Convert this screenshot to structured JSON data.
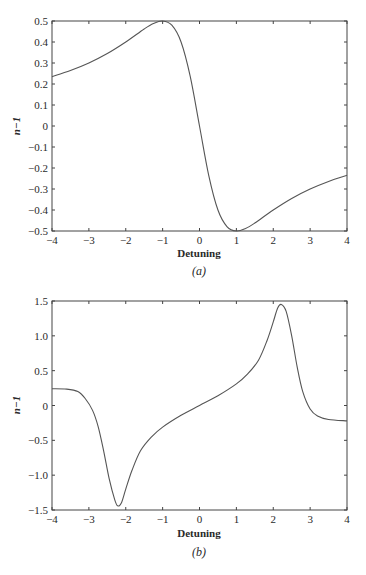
{
  "chart_data": [
    {
      "id": "a",
      "type": "line",
      "caption": "(a)",
      "title": "",
      "xlabel": "Detuning",
      "ylabel": "n−1",
      "xlim": [
        -4,
        4
      ],
      "ylim": [
        -0.5,
        0.5
      ],
      "xticks": [
        -4,
        -3,
        -2,
        -1,
        0,
        1,
        2,
        3,
        4
      ],
      "xtick_labels": [
        "−4",
        "−3",
        "−2",
        "−1",
        "0",
        "1",
        "2",
        "3",
        "4"
      ],
      "yticks": [
        -0.5,
        -0.4,
        -0.3,
        -0.2,
        -0.1,
        0,
        0.1,
        0.2,
        0.3,
        0.4,
        0.5
      ],
      "ytick_labels": [
        "−0.5",
        "−0.4",
        "−0.3",
        "−0.2",
        "−0.1",
        "0",
        "0.1",
        "0.2",
        "0.3",
        "0.4",
        "0.5"
      ],
      "grid": false,
      "series": [
        {
          "name": "n−1",
          "x": [
            -4,
            -3.5,
            -3,
            -2.5,
            -2,
            -1.5,
            -1.25,
            -1,
            -0.75,
            -0.5,
            -0.25,
            0,
            0.25,
            0.5,
            0.75,
            1,
            1.25,
            1.5,
            2,
            2.5,
            3,
            3.5,
            4
          ],
          "y": [
            0.235,
            0.264,
            0.3,
            0.345,
            0.4,
            0.462,
            0.488,
            0.5,
            0.48,
            0.4,
            0.235,
            0,
            -0.235,
            -0.4,
            -0.48,
            -0.5,
            -0.488,
            -0.462,
            -0.4,
            -0.345,
            -0.3,
            -0.264,
            -0.235
          ]
        }
      ]
    },
    {
      "id": "b",
      "type": "line",
      "caption": "(b)",
      "title": "",
      "xlabel": "Detuning",
      "ylabel": "n−1",
      "xlim": [
        -4,
        4
      ],
      "ylim": [
        -1.5,
        1.5
      ],
      "xticks": [
        -4,
        -3,
        -2,
        -1,
        0,
        1,
        2,
        3,
        4
      ],
      "xtick_labels": [
        "−4",
        "−3",
        "−2",
        "−1",
        "0",
        "1",
        "2",
        "3",
        "4"
      ],
      "yticks": [
        -1.5,
        -1.0,
        -0.5,
        0,
        0.5,
        1.0,
        1.5
      ],
      "ytick_labels": [
        "−1.5",
        "−1.0",
        "−0.5",
        "0",
        "0.5",
        "1.0",
        "1.5"
      ],
      "grid": false,
      "series": [
        {
          "name": "n−1",
          "x": [
            -4,
            -3.6,
            -3.3,
            -3.1,
            -2.9,
            -2.75,
            -2.6,
            -2.45,
            -2.3,
            -2.22,
            -2.12,
            -2.0,
            -1.83,
            -1.6,
            -1.3,
            -1.0,
            -0.5,
            0,
            0.5,
            1.0,
            1.3,
            1.6,
            1.83,
            2.0,
            2.12,
            2.22,
            2.35,
            2.5,
            2.65,
            2.8,
            3.0,
            3.2,
            3.5,
            4
          ],
          "y": [
            0.24,
            0.235,
            0.2,
            0.1,
            -0.07,
            -0.3,
            -0.65,
            -1.05,
            -1.35,
            -1.44,
            -1.4,
            -1.2,
            -0.93,
            -0.65,
            -0.45,
            -0.31,
            -0.14,
            0,
            0.14,
            0.31,
            0.45,
            0.65,
            0.93,
            1.2,
            1.4,
            1.45,
            1.35,
            1.0,
            0.55,
            0.2,
            -0.05,
            -0.15,
            -0.2,
            -0.22
          ]
        }
      ]
    }
  ]
}
